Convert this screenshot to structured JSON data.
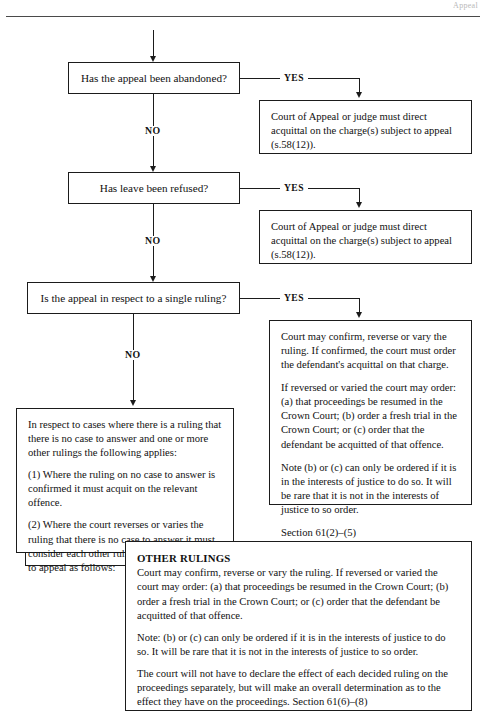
{
  "page": {
    "header_partial_text": "Appeal",
    "width": 486,
    "height": 723,
    "ink_color": "#1b1b1b",
    "background_color": "#ffffff"
  },
  "flowchart": {
    "title": "Prosecution appeal outcomes flowchart",
    "branch_labels": {
      "yes": "YES",
      "no": "NO"
    },
    "decisions": [
      {
        "id": "abandoned",
        "question": "Has the appeal been abandoned?"
      },
      {
        "id": "leave-refused",
        "question": "Has leave been refused?"
      },
      {
        "id": "single-ruling",
        "question": "Is the appeal in respect to a single ruling?"
      }
    ],
    "outcomes": [
      {
        "id": "abandoned-outcome",
        "paragraphs": [
          "Court of Appeal or judge must direct acquittal on the charge(s) subject to appeal (s.58(12))."
        ]
      },
      {
        "id": "leave-refused-outcome",
        "paragraphs": [
          "Court of Appeal or judge must direct acquittal on the charge(s) subject to appeal (s.58(12))."
        ]
      },
      {
        "id": "single-ruling-outcome",
        "paragraphs": [
          "Court may confirm, reverse or vary the ruling. If confirmed, the court must order the defendant's acquittal on that charge.",
          "If reversed or varied the court may order: (a) that proceedings be resumed in the Crown Court; (b) order a fresh trial in the Crown Court; or (c) order that the defendant be acquitted of that offence.",
          "Note (b) or (c) can only be ordered if it is in the interests of justice to do so. It will be rare that it is not in the interests of justice to so order.",
          "Section 61(2)–(5)"
        ]
      },
      {
        "id": "multiple-rulings-outcome",
        "paragraphs": [
          "In respect to cases where there is a ruling that there is no case to answer and one or more other rulings the following applies:",
          "(1) Where the ruling on no case to answer is confirmed it must acquit on the relevant offence.",
          "(2) Where the court reverses or varies the ruling that there is no case to answer it must consider each other ruling that is the subject to appeal as follows:"
        ]
      },
      {
        "id": "other-rulings-outcome",
        "heading": "OTHER RULINGS",
        "paragraphs": [
          "Court may confirm, reverse or vary the ruling. If reversed or varied the court may order: (a) that proceedings be resumed in the Crown Court; (b) order a fresh trial in the Crown Court; or (c) order that the defendant be acquitted of that offence.",
          "Note: (b) or (c) can only be ordered if it is in the interests of justice to do so. It will be rare that it is not in the interests of justice to so order.",
          "The court will not have to declare the effect of each decided ruling on the proceedings separately, but will make an overall determination as to the effect they have on the proceedings. Section 61(6)–(8)"
        ]
      }
    ]
  }
}
